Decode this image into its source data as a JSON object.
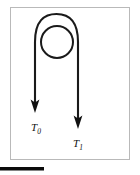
{
  "figure": {
    "title": "",
    "background_color": "#ffffff",
    "frame": {
      "name": "figure-border",
      "x": 10,
      "y": 7,
      "width": 120,
      "height": 153,
      "stroke_color": "#b9b9b9",
      "stroke_width": 1,
      "fill": "none"
    },
    "curve": {
      "name": "looped-path",
      "description": "hairpin arch with a loop at the top; two downward arrows at the ends",
      "stroke_color": "#1a1a1a",
      "stroke_width": 2.1,
      "left_branch_x": 35,
      "right_branch_x": 78,
      "apex_y": 18,
      "left_arrow_tip_y": 112,
      "right_arrow_tip_y": 128
    },
    "loop_circle": {
      "name": "loop-circle",
      "center_x": 57,
      "center_y": 42,
      "radius": 16,
      "stroke_color": "#1a1a1a",
      "stroke_width": 2.0,
      "fill": "none"
    },
    "arrows": [
      {
        "name": "arrowhead-left",
        "tip_x": 35,
        "tip_y": 113,
        "direction": "down",
        "color": "#111111"
      },
      {
        "name": "arrowhead-right",
        "tip_x": 78,
        "tip_y": 129,
        "direction": "down",
        "color": "#111111"
      }
    ],
    "labels": [
      {
        "name": "label-t0",
        "symbol": "T",
        "subscript": "0",
        "full": "T0",
        "x": 31,
        "y": 129,
        "color": "#111111"
      },
      {
        "name": "label-t1",
        "symbol": "T",
        "subscript": "1",
        "full": "T1",
        "x": 73,
        "y": 145,
        "color": "#111111"
      }
    ],
    "footer_bar": {
      "name": "footer-rule",
      "x": 0,
      "y": 167,
      "width": 44,
      "height": 3.5,
      "color": "#0b0b0b"
    }
  }
}
